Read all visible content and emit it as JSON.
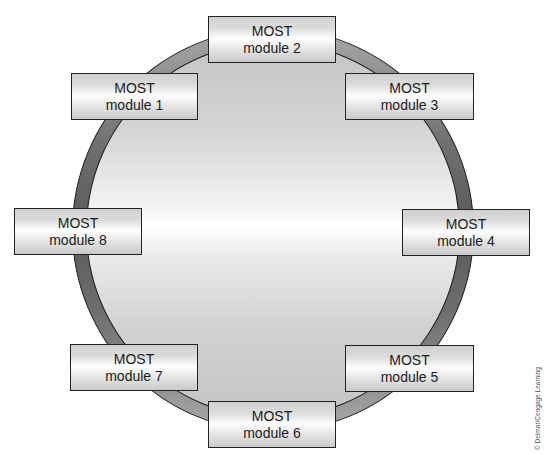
{
  "diagram": {
    "type": "ring network",
    "colors": {
      "ring": "#6e6e6e",
      "disc_center": "#ffffff",
      "disc_edge": "#c4c4c4",
      "module_border": "#222222",
      "text": "#1c1c1c"
    },
    "modules": [
      {
        "id": 1,
        "line1": "MOST",
        "line2": "module 1"
      },
      {
        "id": 2,
        "line1": "MOST",
        "line2": "module 2"
      },
      {
        "id": 3,
        "line1": "MOST",
        "line2": "module 3"
      },
      {
        "id": 4,
        "line1": "MOST",
        "line2": "module 4"
      },
      {
        "id": 5,
        "line1": "MOST",
        "line2": "module 5"
      },
      {
        "id": 6,
        "line1": "MOST",
        "line2": "module 6"
      },
      {
        "id": 7,
        "line1": "MOST",
        "line2": "module 7"
      },
      {
        "id": 8,
        "line1": "MOST",
        "line2": "module 8"
      }
    ],
    "copyright": "© Delmar/Cengage Learning"
  }
}
